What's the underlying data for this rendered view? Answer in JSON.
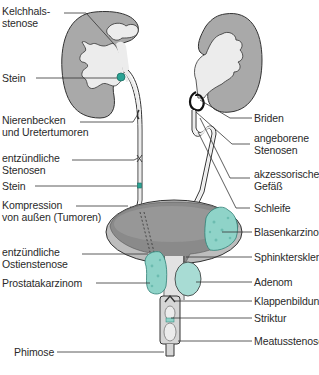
{
  "diagram": {
    "colors": {
      "kidney_cortex": "#a9a9a9",
      "kidney_pelvis": "#ececec",
      "tumor": "#8fd3c8",
      "stone": "#2aa394",
      "bladder_wall": "#bdbdbd",
      "bladder_lumen": "#8a8a8a",
      "outline": "#333333",
      "leader_line": "#333333"
    },
    "left_labels": [
      {
        "id": "kelchhalsstenose",
        "lines": [
          "Kelchhals-",
          "stenose"
        ]
      },
      {
        "id": "stein-niere",
        "lines": [
          "Stein"
        ]
      },
      {
        "id": "nierenbecken-uretertumoren",
        "lines": [
          "Nierenbecken",
          "und Uretertumoren"
        ]
      },
      {
        "id": "entzuendliche-stenosen",
        "lines": [
          "entzündliche",
          "Stenosen"
        ]
      },
      {
        "id": "stein-ureter",
        "lines": [
          "Stein"
        ]
      },
      {
        "id": "kompression",
        "lines": [
          "Kompression",
          "von außen (Tumoren)"
        ]
      },
      {
        "id": "ostienstenose",
        "lines": [
          "entzündliche",
          "Ostienstenose"
        ]
      },
      {
        "id": "prostatakarzinom",
        "lines": [
          "Prostatakarzinom"
        ]
      },
      {
        "id": "phimose",
        "lines": [
          "Phimose"
        ]
      }
    ],
    "right_labels": [
      {
        "id": "briden",
        "lines": [
          "Briden"
        ]
      },
      {
        "id": "angeborene-stenosen",
        "lines": [
          "angeborene",
          "Stenosen"
        ]
      },
      {
        "id": "akzessorisches-gefaess",
        "lines": [
          "akzessorisches",
          "Gefäß"
        ]
      },
      {
        "id": "schleife",
        "lines": [
          "Schleife"
        ]
      },
      {
        "id": "blasenkarzinom",
        "lines": [
          "Blasenkarzinom"
        ]
      },
      {
        "id": "sphinktersklerose",
        "lines": [
          "Sphinktersklerose"
        ]
      },
      {
        "id": "adenom",
        "lines": [
          "Adenom"
        ]
      },
      {
        "id": "klappenbildung",
        "lines": [
          "Klappenbildung"
        ]
      },
      {
        "id": "striktur",
        "lines": [
          "Striktur"
        ]
      },
      {
        "id": "meatusstenose",
        "lines": [
          "Meatusstenose"
        ]
      }
    ]
  }
}
